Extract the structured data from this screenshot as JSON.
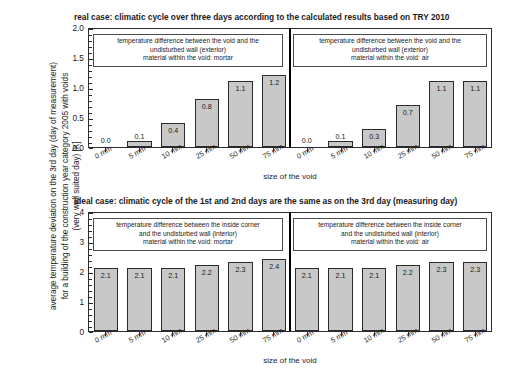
{
  "axis": {
    "ylabel_lines": [
      "average temperature deviation on the 3rd day (day of measurement)",
      "for a building of the construction year category 2005 with voids",
      "(very well suited day) [K]"
    ],
    "xlabel": "size of the void"
  },
  "panels": {
    "top": {
      "title": "real case: climatic cycle over three days according to the calculated results based on TRY 2010",
      "legend_left": [
        "temperature difference between the void and the",
        "undisturbed wall (exterior)",
        "material within the void: mortar"
      ],
      "legend_right": [
        "temperature difference between the void and the",
        "undisturbed wall (exterior)",
        "material within the void: air"
      ],
      "yticks": [
        "0.0",
        "0.5",
        "1.0",
        "1.5",
        "2.0"
      ]
    },
    "bottom": {
      "title": "ideal case: climatic cycle of the 1st and 2nd days are the same as on the 3rd day (measuring day)",
      "legend_left": [
        "temperature difference between the inside corner",
        "and the undisturbed wall (interior)",
        "material within the void: mortar"
      ],
      "legend_right": [
        "temperature difference between the inside corner",
        "and the undisturbed wall (interior)",
        "material within the void: air"
      ],
      "yticks": [
        "0",
        "1",
        "2",
        "3",
        "4"
      ]
    }
  },
  "chart_data": [
    {
      "type": "bar",
      "title": "real case: climatic cycle over three days according to the calculated results based on TRY 2010",
      "subplot": "top-left",
      "categories": [
        "0 mm",
        "5 mm",
        "10 mm",
        "25 mm",
        "50 mm",
        "75 mm"
      ],
      "values": [
        0.0,
        0.1,
        0.4,
        0.8,
        1.1,
        1.2
      ],
      "labels": [
        "0.0",
        "0.1",
        "0.4",
        "0.8",
        "1.1",
        "1.2"
      ],
      "xlabel": "size of the void",
      "ylabel": "average temperature deviation on the 3rd day (day of measurement) for a building of the construction year category 2005 with voids (very well suited day) [K]",
      "ylim": [
        0,
        2.0
      ],
      "ytick_values": [
        0.0,
        0.5,
        1.0,
        1.5,
        2.0
      ],
      "grid": false,
      "legend": [
        "temperature difference between the void and the undisturbed wall (exterior)",
        "material within the void: mortar"
      ],
      "legend_position": "inside-top-left"
    },
    {
      "type": "bar",
      "subplot": "top-right",
      "categories": [
        "0 mm",
        "5 mm",
        "10 mm",
        "25 mm",
        "50 mm",
        "75 mm"
      ],
      "values": [
        0.0,
        0.1,
        0.3,
        0.7,
        1.1,
        1.1
      ],
      "labels": [
        "0.0",
        "0.1",
        "0.3",
        "0.7",
        "1.1",
        "1.1"
      ],
      "xlabel": "size of the void",
      "ylim": [
        0,
        2.0
      ],
      "ytick_values": [
        0.0,
        0.5,
        1.0,
        1.5,
        2.0
      ],
      "grid": false,
      "legend": [
        "temperature difference between the void and the undisturbed wall (exterior)",
        "material within the void: air"
      ],
      "legend_position": "inside-top-right"
    },
    {
      "type": "bar",
      "title": "ideal case: climatic cycle of the 1st and 2nd days are the same as on the 3rd day (measuring day)",
      "subplot": "bottom-left",
      "categories": [
        "0 mm",
        "5 mm",
        "10 mm",
        "25 mm",
        "50 mm",
        "75 mm"
      ],
      "values": [
        2.1,
        2.1,
        2.1,
        2.2,
        2.3,
        2.4
      ],
      "labels": [
        "2.1",
        "2.1",
        "2.1",
        "2.2",
        "2.3",
        "2.4"
      ],
      "xlabel": "size of the void",
      "ylim": [
        0,
        4
      ],
      "ytick_values": [
        0,
        1,
        2,
        3,
        4
      ],
      "grid": false,
      "legend": [
        "temperature difference between the inside corner and the undisturbed wall (interior)",
        "material within the void: mortar"
      ],
      "legend_position": "inside-top-left"
    },
    {
      "type": "bar",
      "subplot": "bottom-right",
      "categories": [
        "0 mm",
        "5 mm",
        "10 mm",
        "25 mm",
        "50 mm",
        "75 mm"
      ],
      "values": [
        2.1,
        2.1,
        2.1,
        2.2,
        2.3,
        2.3
      ],
      "labels": [
        "2.1",
        "2.1",
        "2.1",
        "2.2",
        "2.3",
        "2.3"
      ],
      "xlabel": "size of the void",
      "ylim": [
        0,
        4
      ],
      "ytick_values": [
        0,
        1,
        2,
        3,
        4
      ],
      "grid": false,
      "legend": [
        "temperature difference between the inside corner and the undisturbed wall (interior)",
        "material within the void: air"
      ],
      "legend_position": "inside-top-right"
    }
  ],
  "colors": {
    "bar_fill": "#c8c8c8",
    "bar_stroke": "#2b2b2b",
    "frame": "#2b2b2b",
    "text": "#1a1a1a"
  }
}
